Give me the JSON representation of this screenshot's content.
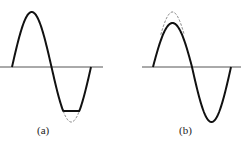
{
  "figure": {
    "panels": [
      {
        "id": "a",
        "label": "(a)",
        "description": "sine wave with negative half-cycle clipped (flattened trough); dashed curve shows unclipped waveform",
        "clipped_half": "negative",
        "clip_level_fraction": 0.8
      },
      {
        "id": "b",
        "label": "(b)",
        "description": "sine wave with positive half-cycle peak compressed; dashed curve shows unclipped waveform",
        "clipped_half": "positive",
        "clip_level_fraction": 0.8
      }
    ]
  },
  "colors": {
    "waveform": "#111111",
    "axis": "#555555",
    "ideal_dashed": "#666666"
  }
}
